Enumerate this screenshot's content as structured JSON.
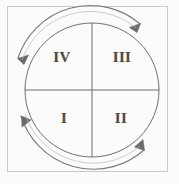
{
  "figure": {
    "background_color": "#fbfbfa",
    "frame": {
      "name": "outer-frame",
      "stroke_color": "#c9c9c9",
      "x": 7,
      "y": 6,
      "width": 161,
      "height": 166
    },
    "circle": {
      "name": "main-circle",
      "stroke_color": "#6f6f6f",
      "center_x": 92,
      "center_y": 90,
      "radius": 67
    },
    "axes": {
      "stroke_color": "#6f6f6f",
      "vertical_label": "vertical-diameter",
      "horizontal_label": "horizontal-diameter"
    },
    "quadrants": [
      {
        "id": "iv",
        "label": "IV",
        "position": "upper-left",
        "x": 62,
        "y": 57
      },
      {
        "id": "iii",
        "label": "III",
        "position": "upper-right",
        "x": 122,
        "y": 57
      },
      {
        "id": "i",
        "label": "I",
        "position": "lower-left",
        "x": 64,
        "y": 118
      },
      {
        "id": "ii",
        "label": "II",
        "position": "lower-right",
        "x": 121,
        "y": 118
      }
    ],
    "arrows": {
      "stroke_color": "#7a7a7a",
      "direction": "counterclockwise",
      "items": [
        {
          "id": "arc-top",
          "name": "rotation-arrow-top",
          "head": "up-left-at-top-right"
        },
        {
          "id": "arc-left",
          "name": "rotation-arrow-left",
          "head": "down-left-at-upper-left"
        },
        {
          "id": "arc-bottom",
          "name": "rotation-arrow-bottom",
          "head": "down-right-at-lower-left"
        },
        {
          "id": "arc-right",
          "name": "rotation-arrow-right",
          "head": "up-right-at-lower-right"
        }
      ]
    },
    "text_color": "#4a4a4a"
  }
}
